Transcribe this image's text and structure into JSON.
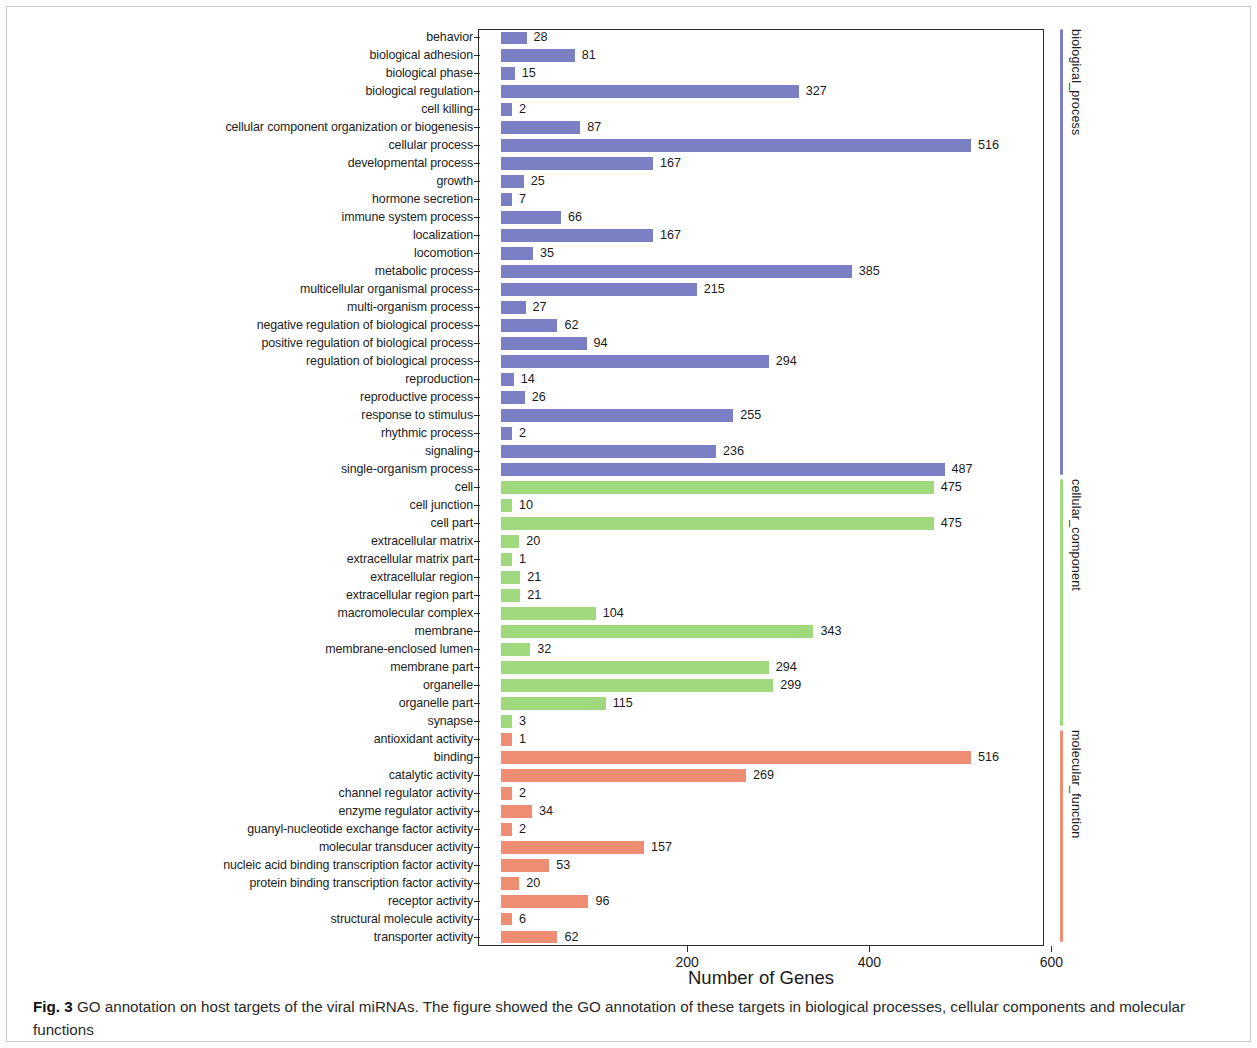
{
  "figure": {
    "caption_label": "Fig. 3",
    "caption_text": " GO annotation on host targets of the viral miRNAs. The figure showed the GO annotation of these targets in biological processes, cellular components and molecular functions"
  },
  "legend": {
    "groups": [
      {
        "label": "biological_process",
        "color": "#7b7fc4"
      },
      {
        "label": "cellular_component",
        "color": "#9fdb7e"
      },
      {
        "label": "molecular_function",
        "color": "#ef8d72"
      }
    ]
  },
  "chart_data": {
    "type": "bar",
    "orientation": "horizontal",
    "title": "",
    "xlabel": "Number of Genes",
    "ylabel": "",
    "xlim": [
      0,
      620
    ],
    "xticks": [
      200,
      400,
      600
    ],
    "grid": false,
    "legend_position": "right-vertical",
    "colors": {
      "biological_process": "#7b7fc4",
      "cellular_component": "#9fdb7e",
      "molecular_function": "#ef8d72"
    },
    "series": [
      {
        "name": "biological_process",
        "color": "#7b7fc4",
        "categories": [
          "behavior",
          "biological adhesion",
          "biological phase",
          "biological regulation",
          "cell killing",
          "cellular component organization or biogenesis",
          "cellular process",
          "developmental process",
          "growth",
          "hormone secretion",
          "immune system process",
          "localization",
          "locomotion",
          "metabolic process",
          "multicellular organismal process",
          "multi-organism process",
          "negative regulation of biological process",
          "positive regulation of biological process",
          "regulation of biological process",
          "reproduction",
          "reproductive process",
          "response to stimulus",
          "rhythmic process",
          "signaling",
          "single-organism process"
        ],
        "values": [
          28,
          81,
          15,
          327,
          2,
          87,
          516,
          167,
          25,
          7,
          66,
          167,
          35,
          385,
          215,
          27,
          62,
          94,
          294,
          14,
          26,
          255,
          2,
          236,
          487
        ]
      },
      {
        "name": "cellular_component",
        "color": "#9fdb7e",
        "categories": [
          "cell",
          "cell junction",
          "cell part",
          "extracellular matrix",
          "extracellular matrix part",
          "extracellular region",
          "extracellular region part",
          "macromolecular complex",
          "membrane",
          "membrane-enclosed lumen",
          "membrane part",
          "organelle",
          "organelle part",
          "synapse"
        ],
        "values": [
          475,
          10,
          475,
          20,
          1,
          21,
          21,
          104,
          343,
          32,
          294,
          299,
          115,
          3
        ]
      },
      {
        "name": "molecular_function",
        "color": "#ef8d72",
        "categories": [
          "antioxidant activity",
          "binding",
          "catalytic activity",
          "channel regulator activity",
          "enzyme regulator activity",
          "guanyl-nucleotide exchange factor activity",
          "molecular transducer activity",
          "nucleic acid binding transcription factor activity",
          "protein binding transcription factor activity",
          "receptor activity",
          "structural molecule activity",
          "transporter activity"
        ],
        "values": [
          1,
          516,
          269,
          2,
          34,
          2,
          157,
          53,
          20,
          96,
          6,
          62
        ]
      }
    ]
  }
}
